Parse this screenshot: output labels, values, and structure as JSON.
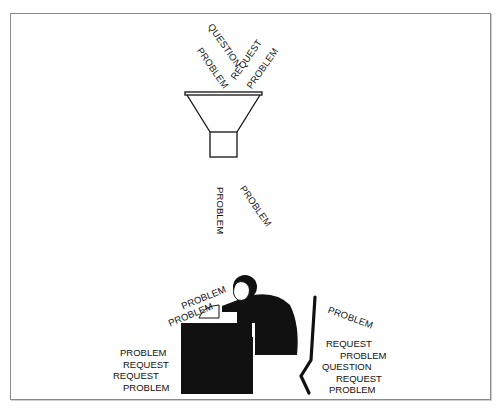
{
  "diagram": {
    "title": "",
    "funnel_inputs": [
      {
        "text": "QUESTION",
        "rotation_deg": 55
      },
      {
        "text": "PROBLEM",
        "rotation_deg": 55
      },
      {
        "text": "REQUEST",
        "rotation_deg": -55
      },
      {
        "text": "PROBLEM",
        "rotation_deg": -55
      }
    ],
    "falling_items": [
      {
        "text": "PROBLEM",
        "rotation_deg": 90
      },
      {
        "text": "PROBLEM",
        "rotation_deg": 55
      }
    ],
    "desk_incoming": [
      {
        "text": "PROBLEM",
        "rotation_deg": -22
      },
      {
        "text": "PROBLEM",
        "rotation_deg": -22
      }
    ],
    "left_stack": [
      "PROBLEM",
      "REQUEST",
      "REQUEST",
      "PROBLEM"
    ],
    "right_tilted": {
      "text": "PROBLEM",
      "rotation_deg": 20
    },
    "right_stack": [
      "REQUEST",
      "PROBLEM",
      "QUESTION",
      "REQUEST",
      "PROBLEM"
    ],
    "figures": {
      "funnel": "funnel-icon",
      "person": "overwhelmed-worker-at-desk",
      "chair": "chair-outline"
    },
    "colors": {
      "ink": "#111111",
      "border": "#8a8a8a",
      "background": "#ffffff"
    }
  }
}
